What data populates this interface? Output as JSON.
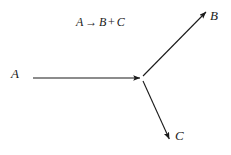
{
  "figure": {
    "type": "reaction-diagram",
    "background_color": "#ffffff",
    "stroke_color": "#1a1a1a",
    "equation": {
      "full_text": "A → B + C",
      "reactant": "A",
      "arrow_glyph": "→",
      "product_1": "B",
      "plus_glyph": "+",
      "product_2": "C"
    },
    "nodes": [
      {
        "id": "A",
        "label": "A",
        "role": "reactant",
        "x": 11,
        "y": 67
      },
      {
        "id": "B",
        "label": "B",
        "role": "product",
        "x": 210,
        "y": 9
      },
      {
        "id": "C",
        "label": "C",
        "role": "product",
        "x": 175,
        "y": 129
      }
    ],
    "junction": {
      "x": 141,
      "y": 78
    },
    "arrows": [
      {
        "id": "arrow-A-to-junction",
        "from_label": "A",
        "to_label": "junction",
        "x1": 33,
        "y1": 78,
        "x2": 141,
        "y2": 78,
        "direction": "right"
      },
      {
        "id": "arrow-junction-to-B",
        "from_label": "junction",
        "to_label": "B",
        "x1": 143,
        "y1": 76,
        "x2": 207,
        "y2": 11,
        "direction": "up-right"
      },
      {
        "id": "arrow-junction-to-C",
        "from_label": "junction",
        "to_label": "C",
        "x1": 143,
        "y1": 81,
        "x2": 170,
        "y2": 140,
        "direction": "down-right"
      }
    ]
  }
}
